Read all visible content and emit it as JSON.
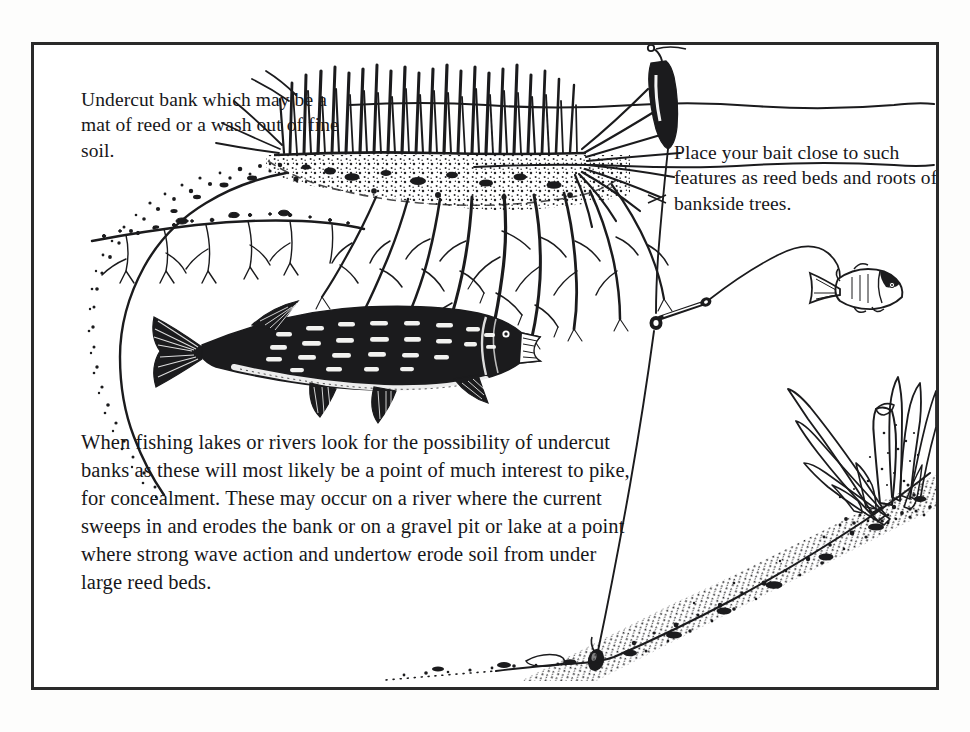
{
  "page": {
    "type": "book-illustration",
    "background": "#ffffff",
    "frame_color": "#2a2a2a"
  },
  "captions": {
    "top_left": "Undercut bank which may be a mat of reed or a wash out of fine soil.",
    "right": "Place your bait close to such features as reed beds and roots of bankside trees.",
    "body": "When fishing lakes or rivers look for the possibility of undercut banks as these will most likely be a point of much interest to pike, for concealment. These may occur on a river where the current sweeps in and erodes the bank or on a gravel pit or lake at a point where strong wave action and undertow erode soil from under large reed beds."
  },
  "scene": {
    "elements": [
      {
        "name": "water-surface-line",
        "label": "Water surface"
      },
      {
        "name": "reed-bed",
        "label": "Reed bed / mat of reed"
      },
      {
        "name": "reed-roots",
        "label": "Roots of bankside reeds"
      },
      {
        "name": "undercut-bank",
        "label": "Undercut bank"
      },
      {
        "name": "pike-fish",
        "label": "Pike in the undercut"
      },
      {
        "name": "float-bobber",
        "label": "Float"
      },
      {
        "name": "fishing-line",
        "label": "Fishing line"
      },
      {
        "name": "swivel-link",
        "label": "Swivel / trace link"
      },
      {
        "name": "bait-fish",
        "label": "Live bait fish"
      },
      {
        "name": "lead-weight",
        "label": "Lead weight"
      },
      {
        "name": "lake-bed-slope",
        "label": "Sloping lake bed"
      },
      {
        "name": "weed-growth",
        "label": "Weed growth"
      }
    ]
  },
  "colors": {
    "ink": "#1b1b1d",
    "frame": "#2a2a2a",
    "paper": "#ffffff"
  }
}
